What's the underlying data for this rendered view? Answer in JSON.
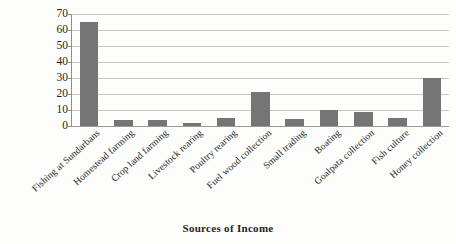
{
  "chart_data": {
    "type": "bar",
    "title": "",
    "subtitle": "",
    "xlabel": "Sources of Income",
    "ylabel": "Percentage",
    "categories": [
      "Fishing at Sundarbans",
      "Homestead farming",
      "Crop land farming",
      "Livestock rearing",
      "Poultry rearing",
      "Fuel wood collection",
      "Small trading",
      "Boating",
      "Goalpata collection",
      "Fish culture",
      "Honey collection"
    ],
    "values": [
      65,
      4,
      4,
      2,
      5,
      21,
      4.5,
      10,
      9,
      5,
      30
    ],
    "ylim": [
      0,
      70
    ],
    "ytick_labels": [
      "70",
      "60",
      "50",
      "40",
      "30",
      "20",
      "10",
      "0"
    ],
    "ytick_values": [
      70,
      60,
      50,
      40,
      30,
      20,
      10,
      0
    ],
    "ytick_step": 10,
    "grid": true,
    "grid_axis": "y",
    "legend": false,
    "legend_position": "none",
    "series": [
      {
        "name": "Percentage",
        "values": [
          65,
          4,
          4,
          2,
          5,
          21,
          4.5,
          10,
          9,
          5,
          30
        ]
      }
    ],
    "xtick_rotation": -42,
    "colors": {
      "bar_fill": "#757575",
      "gridline": "#c9c9c9",
      "axis_line": "#8d8d8d",
      "text": "#1d1d1d",
      "background": "#fdfdfb"
    }
  }
}
